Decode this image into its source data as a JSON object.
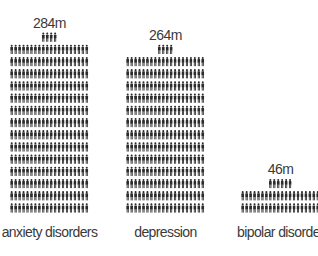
{
  "chart_data": {
    "type": "bar",
    "style": "isotype pictogram (each person figure = 1 million)",
    "title": "",
    "xlabel": "",
    "ylabel": "",
    "unit_per_icon": "1m people",
    "icons_per_row": 20,
    "categories": [
      "anxiety disorders",
      "depression",
      "bipolar disorder"
    ],
    "values": [
      284,
      264,
      46
    ],
    "value_labels": [
      "284m",
      "264m",
      "46m"
    ],
    "grid": false,
    "legend": "none",
    "colors": {
      "icon": "#2b2b2b",
      "text": "#3a3a3a",
      "background": "#ffffff"
    }
  }
}
